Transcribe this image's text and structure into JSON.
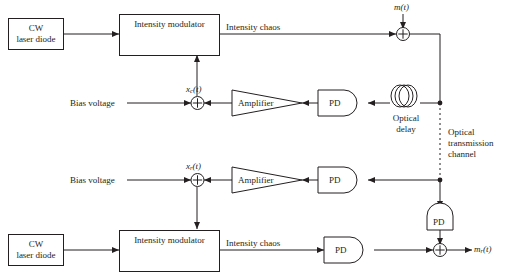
{
  "figure": {
    "type": "block-diagram",
    "background": "#ffffff",
    "line_color": "#231f20"
  },
  "blocks": {
    "cw_laser_top": {
      "line1": "CW",
      "line2": "laser diode"
    },
    "cw_laser_bottom": {
      "line1": "CW",
      "line2": "laser diode"
    },
    "intensity_modulator_top": {
      "label": "Intensity modulator"
    },
    "intensity_modulator_bottom": {
      "label": "Intensity modulator"
    },
    "amplifier_top": {
      "label": "Amplifier"
    },
    "amplifier_bottom": {
      "label": "Amplifier"
    },
    "pd_top": {
      "label": "PD"
    },
    "pd_mid": {
      "label": "PD"
    },
    "pd_right": {
      "label": "PD"
    },
    "pd_bottom": {
      "label": "PD"
    }
  },
  "labels": {
    "intensity_chaos_top": "Intensity chaos",
    "intensity_chaos_bottom": "Intensity chaos",
    "bias_voltage_top": "Bias voltage",
    "bias_voltage_bottom": "Bias voltage",
    "optical_delay": "Optical\ndelay",
    "optical_delay_line1": "Optical",
    "optical_delay_line2": "delay",
    "optical_channel_line1": "Optical",
    "optical_channel_line2": "transmission",
    "optical_channel_line3": "channel",
    "signal_m_t": "m(t)",
    "signal_m_r_t": "m",
    "signal_m_r_t_sub": "r",
    "signal_m_r_t_tail": "(t)",
    "signal_x_c_t": "x",
    "signal_x_c_t_sub": "c",
    "signal_x_c_t_tail": "(t)",
    "signal_x_r_t": "x",
    "signal_x_r_t_sub": "r",
    "signal_x_r_t_tail": "(t)"
  }
}
